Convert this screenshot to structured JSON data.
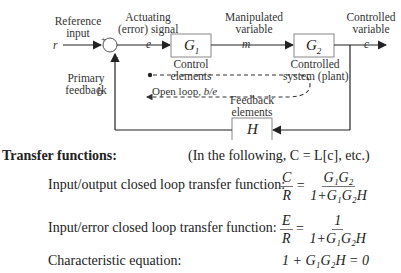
{
  "diagram": {
    "labels": {
      "reference_input": [
        "Reference",
        "input"
      ],
      "actuating_signal": [
        "Actuating",
        "(error) signal"
      ],
      "manipulated_variable": [
        "Manipulated",
        "variable"
      ],
      "controlled_variable": [
        "Controlled",
        "variable"
      ],
      "primary_feedback": [
        "Primary",
        "feedback"
      ],
      "control_elements": [
        "Control",
        "elements"
      ],
      "controlled_system": [
        "Controlled",
        "system (plant)"
      ],
      "feedback_elements": [
        "Feedback",
        "elements"
      ],
      "open_loop": "Open loop,",
      "open_loop_ratio": "b/e"
    },
    "signals": {
      "r": "r",
      "e": "e",
      "m": "m",
      "c": "c",
      "b": "b"
    },
    "summing_junction": {
      "plus": "+",
      "minus": "-"
    },
    "blocks": {
      "g1": "G",
      "g1_sub": "1",
      "g2": "G",
      "g2_sub": "2",
      "h": "H"
    }
  },
  "transfer": {
    "heading": "Transfer functions:",
    "note": "(In the following, C = L[c], etc.)",
    "rows": [
      {
        "label": "Input/output closed loop transfer function:",
        "lhs_num": "C",
        "lhs_den": "R",
        "rhs_num": "G₁G₂",
        "rhs_den": "1+G₁G₂H"
      },
      {
        "label": "Input/error closed loop transfer function:",
        "lhs_num": "E",
        "lhs_den": "R",
        "rhs_num": "1",
        "rhs_den": "1+G₁G₂H"
      },
      {
        "label": "Characteristic equation:",
        "equation": "1 + G₁G₂H = 0"
      }
    ],
    "equals": "="
  }
}
